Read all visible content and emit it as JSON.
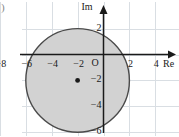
{
  "figure": {
    "corner_mark": ")",
    "background_color": "#ffffff"
  },
  "chart_data": {
    "type": "scatter",
    "title": "",
    "subtitle": "",
    "xlabel": "Re",
    "ylabel": "Im",
    "xlim": [
      -9.5,
      5.5
    ],
    "ylim": [
      -7.5,
      3.0
    ],
    "grid": true,
    "grid_step": 2,
    "grid_color": "#d9dee3",
    "axis_color": "#1a1a1a",
    "legend": "none",
    "x_tick_labels": [
      "−8",
      "−6",
      "−4",
      "−2",
      "2",
      "4"
    ],
    "x_tick_values": [
      -8,
      -6,
      -4,
      -2,
      2,
      4
    ],
    "y_tick_labels": [
      "2",
      "−2",
      "−4",
      "−6"
    ],
    "y_tick_values": [
      2,
      -2,
      -4,
      -6
    ],
    "origin_label": "O",
    "shapes": [
      {
        "kind": "disk",
        "center": [
          -2,
          -2
        ],
        "radius": 4,
        "fill_color": "#d2d2d2",
        "fill_opacity": 1,
        "stroke_color": "#4a4a4a",
        "stroke_width": 1.4,
        "label": ""
      }
    ],
    "points": [
      {
        "name": "circle-center",
        "x": -2,
        "y": -2,
        "color": "#1a1a1a",
        "radius_px": 2.4,
        "label": ""
      }
    ]
  }
}
